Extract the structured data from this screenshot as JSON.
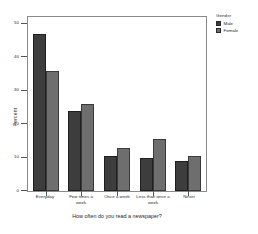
{
  "chart_data": {
    "type": "bar",
    "title": "",
    "xlabel": "How often do you read a newspaper?",
    "ylabel": "Percent",
    "categories": [
      "Everyday",
      "Few times a week",
      "Once a week",
      "Less than once a week",
      "Never"
    ],
    "series": [
      {
        "name": "Male",
        "values": [
          47,
          24,
          10.5,
          10,
          9
        ]
      },
      {
        "name": "Female",
        "values": [
          36,
          26,
          13,
          15.5,
          10.5
        ]
      }
    ],
    "ylim": [
      0,
      52
    ],
    "yticks": [
      0,
      10,
      20,
      30,
      40,
      50
    ],
    "ytick_labels": [
      "0",
      "10",
      "20",
      "30",
      "40",
      "50"
    ],
    "grid": false,
    "legend": {
      "title": "Gender",
      "position": "right",
      "entries": [
        {
          "label": "Male",
          "color": "#3d3d3d"
        },
        {
          "label": "Female",
          "color": "#6e6e6e"
        }
      ]
    },
    "colors": {
      "male": "#3d3d3d",
      "female": "#6e6e6e",
      "frame": "#8a8a8a",
      "background": "#ffffff",
      "text": "#2a2a2a"
    }
  }
}
